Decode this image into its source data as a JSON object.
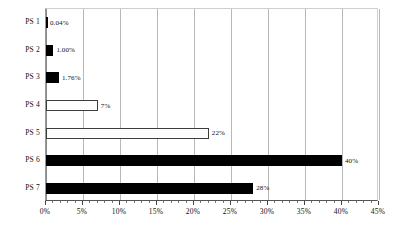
{
  "chart_data": {
    "type": "bar",
    "orientation": "horizontal",
    "title": "",
    "subtitle": "",
    "xlabel": "",
    "ylabel": "",
    "categories": [
      "PS 1",
      "PS 2",
      "PS 3",
      "PS 4",
      "PS 5",
      "PS 6",
      "PS 7"
    ],
    "values": [
      0.04,
      1.0,
      1.76,
      7,
      22,
      40,
      28
    ],
    "value_labels": [
      "0.04%",
      "1.00%",
      "1.76%",
      "7%",
      "22%",
      "40%",
      "28%"
    ],
    "bar_styles": [
      "filled",
      "filled",
      "filled",
      "hollow",
      "hollow",
      "filled",
      "filled"
    ],
    "xlim": [
      0,
      45
    ],
    "xticks": [
      0,
      5,
      10,
      15,
      20,
      25,
      30,
      35,
      40,
      45
    ],
    "xtick_labels": [
      "0%",
      "5%",
      "10%",
      "15%",
      "20%",
      "25%",
      "30%",
      "35%",
      "40%",
      "45%"
    ],
    "minor_ticks_per_interval": 5,
    "grid": "vertical",
    "legend": "none",
    "colors": {
      "bar_fill": "#000000",
      "bar_hollow_fill": "#fdfdfd",
      "bar_outline": "#3d3d3d",
      "gridline": "#b8b8b8",
      "axis": "#555555",
      "text": "#111111",
      "background": "#ffffff"
    }
  }
}
